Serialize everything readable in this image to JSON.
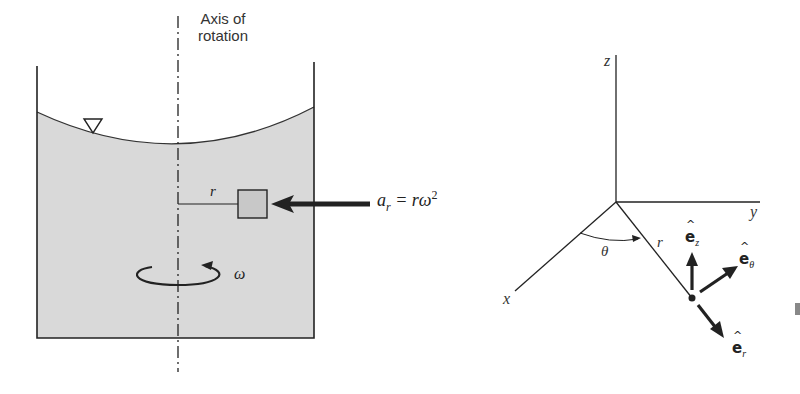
{
  "left_figure": {
    "axis_label_line1": "Axis of",
    "axis_label_line2": "rotation",
    "radius_label": "r",
    "accel_label_a": "a",
    "accel_label_sub": "r",
    "accel_label_eq": " = rω",
    "accel_label_sup": "2",
    "omega_label": "ω",
    "free_surface_symbol": "▽",
    "colors": {
      "fluid": "#d9d9d9",
      "stroke": "#222222",
      "particle": "#cccccc"
    }
  },
  "right_figure": {
    "z_label": "z",
    "y_label": "y",
    "x_label": "x",
    "theta_label": "θ",
    "r_label": "r",
    "unit_vectors": [
      {
        "name": "e_z",
        "base": "e",
        "sub": "z"
      },
      {
        "name": "e_theta",
        "base": "e",
        "sub": "θ"
      },
      {
        "name": "e_r",
        "base": "e",
        "sub": "r"
      }
    ],
    "hat": "^"
  }
}
